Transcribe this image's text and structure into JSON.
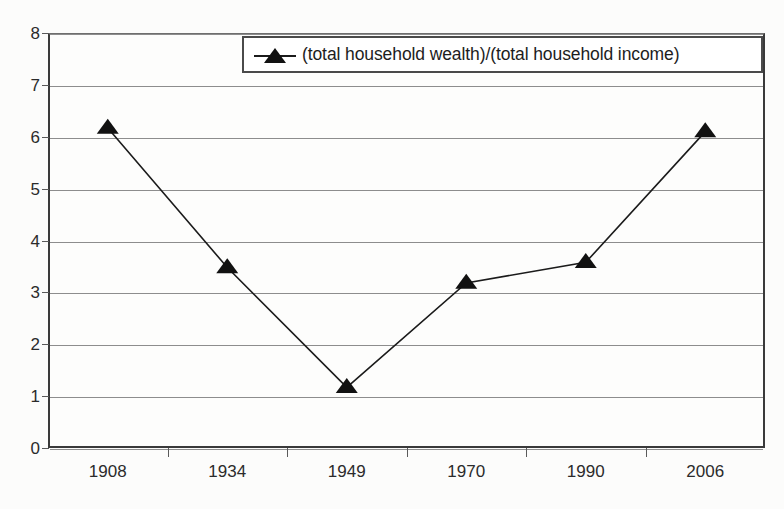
{
  "chart_data": {
    "type": "line",
    "title": "",
    "xlabel": "",
    "ylabel": "",
    "categories": [
      "1908",
      "1934",
      "1949",
      "1970",
      "1990",
      "2006"
    ],
    "values": [
      6.17,
      3.48,
      1.17,
      3.18,
      3.58,
      6.1
    ],
    "series": [
      {
        "name": "(total household wealth)/(total household income)",
        "values": [
          6.17,
          3.48,
          1.17,
          3.18,
          3.58,
          6.1
        ]
      }
    ],
    "ylim": [
      0,
      8
    ],
    "ytick_labels": [
      "0",
      "1",
      "2",
      "3",
      "4",
      "5",
      "6",
      "7",
      "8"
    ],
    "ytick_values": [
      0,
      1,
      2,
      3,
      4,
      5,
      6,
      7,
      8
    ],
    "grid": "horizontal",
    "legend_position": "top-center",
    "marker": "triangle",
    "marker_color": "#111111",
    "line_color": "#1b1b1b",
    "gridline_color": "#8d8d8d",
    "axis_color": "#3a3a3a",
    "background_color": "#fcfcfb"
  },
  "legend": {
    "entries": [
      {
        "label": "(total household wealth)/(total household income)",
        "marker_icon": "triangle-marker-icon"
      }
    ]
  }
}
